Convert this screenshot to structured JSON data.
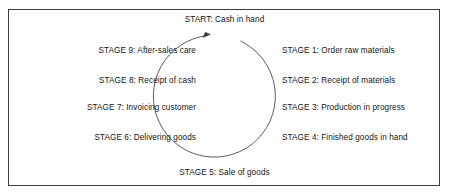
{
  "diagram": {
    "title_text": "START: Cash in hand",
    "start": {
      "label": "START: Cash in hand"
    },
    "bottom": {
      "label": "STAGE 5: Sale of goods"
    },
    "left_stages": [
      {
        "label": "STAGE 9: After-sales care"
      },
      {
        "label": "STAGE 8: Receipt of cash"
      },
      {
        "label": "STAGE 7: Invoicing customer"
      },
      {
        "label": "STAGE 6: Delivering goods"
      }
    ],
    "right_stages": [
      {
        "label": "STAGE 1: Order raw materials"
      },
      {
        "label": "STAGE 2: Receipt of materials"
      },
      {
        "label": "STAGE 3: Production in progress"
      },
      {
        "label": "STAGE 4: Finished goods in hand"
      }
    ],
    "colors": {
      "border": "#3c3c3c",
      "circle_stroke": "#4a4a4a",
      "text": "#141414",
      "background": "#ffffff"
    },
    "shape": {
      "type": "open-circle-with-arrow",
      "direction": "clockwise",
      "center_x": 219,
      "center_y": 98,
      "radius": 61
    }
  }
}
